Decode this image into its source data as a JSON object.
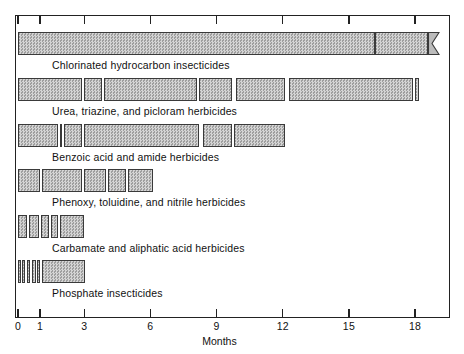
{
  "chart_data": {
    "type": "bar",
    "orientation": "horizontal",
    "title": "",
    "xlabel": "Months",
    "ylabel": "",
    "xlim": [
      0,
      19.6
    ],
    "grid": false,
    "legend": null,
    "xticks": [
      0,
      1,
      3,
      6,
      9,
      12,
      15,
      18
    ],
    "xticklabels": [
      "0",
      "1",
      "3",
      "6",
      "9",
      "12",
      "15",
      "18"
    ],
    "note": "Horizontal range bars (persistence in soil) — each row is a pesticide class; segments are individual compounds stacked end to end along the Months axis.",
    "categories": [
      "Chlorinated hydrocarbon insecticides",
      "Urea, triazine, and picloram herbicides",
      "Benzoic acid and amide herbicides",
      "Phenoxy, toluidine, and nitrile herbicides",
      "Carbamate and aliphatic acid herbicides",
      "Phosphate insecticides"
    ],
    "series": [
      {
        "name": "Chlorinated hydrocarbon insecticides",
        "total_months": 19.0,
        "truncated": true,
        "segments": [
          {
            "start": 0.0,
            "end": 16.2
          },
          {
            "start": 16.2,
            "end": 18.6
          }
        ]
      },
      {
        "name": "Urea, triazine, and picloram herbicides",
        "total_months": 18.2,
        "truncated": false,
        "segments": [
          {
            "start": 0.0,
            "end": 2.9
          },
          {
            "start": 3.0,
            "end": 3.8
          },
          {
            "start": 3.9,
            "end": 8.1
          },
          {
            "start": 8.2,
            "end": 9.7
          },
          {
            "start": 9.9,
            "end": 12.1
          },
          {
            "start": 12.3,
            "end": 17.9
          },
          {
            "start": 18.0,
            "end": 18.2
          }
        ]
      },
      {
        "name": "Benzoic acid and amide herbicides",
        "total_months": 12.1,
        "truncated": false,
        "segments": [
          {
            "start": 0.0,
            "end": 1.8
          },
          {
            "start": 1.9,
            "end": 2.0
          },
          {
            "start": 2.1,
            "end": 2.9
          },
          {
            "start": 3.0,
            "end": 8.2
          },
          {
            "start": 8.4,
            "end": 9.7
          },
          {
            "start": 9.8,
            "end": 12.1
          }
        ]
      },
      {
        "name": "Phenoxy, toluidine, and nitrile herbicides",
        "total_months": 6.1,
        "truncated": false,
        "segments": [
          {
            "start": 0.0,
            "end": 1.0
          },
          {
            "start": 1.1,
            "end": 2.9
          },
          {
            "start": 3.0,
            "end": 4.0
          },
          {
            "start": 4.1,
            "end": 4.9
          },
          {
            "start": 5.0,
            "end": 6.1
          }
        ]
      },
      {
        "name": "Carbamate and aliphatic acid herbicides",
        "total_months": 3.0,
        "truncated": false,
        "segments": [
          {
            "start": 0.0,
            "end": 0.42
          },
          {
            "start": 0.52,
            "end": 0.95
          },
          {
            "start": 1.05,
            "end": 1.42
          },
          {
            "start": 1.5,
            "end": 1.82
          },
          {
            "start": 1.92,
            "end": 3.0
          }
        ]
      },
      {
        "name": "Phosphate insecticides",
        "total_months": 3.04,
        "truncated": false,
        "segments": [
          {
            "start": 0.0,
            "end": 0.14
          },
          {
            "start": 0.2,
            "end": 0.32
          },
          {
            "start": 0.4,
            "end": 0.56
          },
          {
            "start": 0.62,
            "end": 0.8
          },
          {
            "start": 0.88,
            "end": 1.02
          },
          {
            "start": 1.1,
            "end": 3.04
          }
        ]
      }
    ]
  },
  "axis": {
    "x_title": "Months"
  },
  "labels": {
    "row_0": "Chlorinated hydrocarbon insecticides",
    "row_1": "Urea, triazine, and picloram herbicides",
    "row_2": "Benzoic acid and amide herbicides",
    "row_3": "Phenoxy, toluidine, and nitrile herbicides",
    "row_4": "Carbamate and aliphatic acid herbicides",
    "row_5": "Phosphate insecticides"
  },
  "ticks": {
    "t0": "0",
    "t1": "1",
    "t2": "3",
    "t3": "6",
    "t4": "9",
    "t5": "12",
    "t6": "15",
    "t7": "18"
  },
  "colors": {
    "bar_fill": "#b9b9b9",
    "bar_hatch_light": "#d4d4d4",
    "bar_hatch_dark": "#9e9e9e",
    "bar_border": "#3a3a3a",
    "frame": "#222222",
    "text": "#111111",
    "background": "#ffffff"
  }
}
